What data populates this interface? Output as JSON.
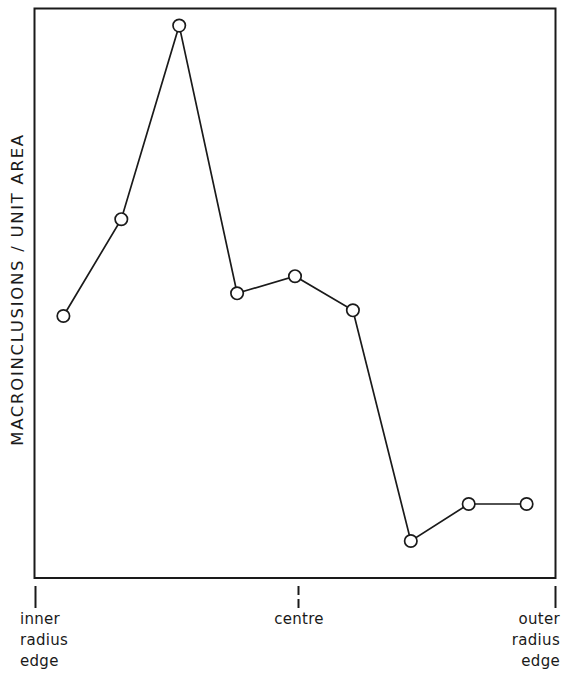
{
  "chart_data": {
    "type": "line",
    "title": "",
    "subtitle": "",
    "xlabel": "",
    "ylabel": "MACROINCLUSIONS / UNIT AREA",
    "grid": false,
    "legend": null,
    "marker": "open-circle",
    "line_color": "#1a1a1a",
    "marker_fill": "#ffffff",
    "x": [
      1,
      2,
      3,
      4,
      5,
      6,
      7,
      8,
      9
    ],
    "values": [
      46,
      63,
      97,
      50,
      53,
      47,
      6.5,
      13,
      13
    ],
    "ylim": [
      0,
      100
    ],
    "xlim": [
      0.5,
      9.5
    ],
    "y_tick_labels": [],
    "x_tick_labels": [
      "inner\nradius\nedge",
      "centre",
      "outer\nradius\nedge"
    ],
    "x_tick_positions": [
      1,
      5,
      9.5
    ],
    "annotations": []
  },
  "axis": {
    "y_title": "MACROINCLUSIONS / UNIT AREA",
    "x_tick_inner": "inner\nradius\nedge",
    "x_tick_centre": "centre",
    "x_tick_outer": "outer\nradius\nedge"
  },
  "colors": {
    "ink": "#1a1a1a",
    "background": "#ffffff"
  }
}
